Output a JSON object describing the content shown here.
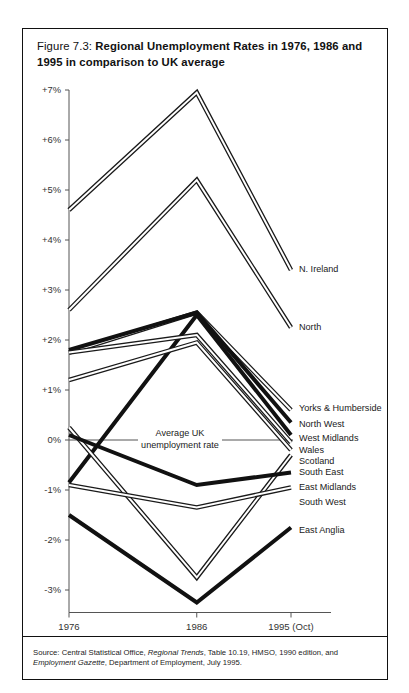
{
  "figure": {
    "number": "Figure 7.3:",
    "title": "Regional Unemployment Rates in 1976, 1986 and 1995 in comparison to UK average",
    "source_prefix": "Source: Central Statistical Office, ",
    "source_italic_1": "Regional Trends",
    "source_mid": ", Table 10.19, HMSO, 1990 edition, and ",
    "source_italic_2": "Employment Gazette",
    "source_suffix": ", Department of Employment, July 1995."
  },
  "annotation": {
    "line1": "Average UK",
    "line2": "unemployment rate"
  },
  "chart_data": {
    "type": "line",
    "title": "Regional Unemployment Rates in 1976, 1986 and 1995 in comparison to UK average",
    "xlabel": "",
    "ylabel": "",
    "x": [
      "1976",
      "1986",
      "1995 (Oct)"
    ],
    "xtick_labels": [
      "1976",
      "1986",
      "1995 (Oct)"
    ],
    "ytick_labels": [
      "+7%",
      "+6%",
      "+5%",
      "+4%",
      "+3%",
      "+2%",
      "+1%",
      "0%",
      "-1%",
      "-2%",
      "-3%"
    ],
    "ytick_values": [
      7,
      6,
      5,
      4,
      3,
      2,
      1,
      0,
      -1,
      -2,
      -3
    ],
    "ylim": [
      -3.5,
      7.3
    ],
    "grid": false,
    "legend": "inline-right-labels",
    "units": "percentage points relative to UK average",
    "series": [
      {
        "name": "N. Ireland",
        "values": [
          4.6,
          6.95,
          3.4
        ],
        "style": "double",
        "label_y": 3.4
      },
      {
        "name": "North",
        "values": [
          2.6,
          5.2,
          2.25
        ],
        "style": "double",
        "label_y": 2.25
      },
      {
        "name": "Yorks & Humberside",
        "values": [
          1.75,
          2.55,
          0.6
        ],
        "style": "double",
        "label_y": 0.62
      },
      {
        "name": "North West",
        "values": [
          1.8,
          2.55,
          0.35
        ],
        "style": "thick",
        "label_y": 0.3
      },
      {
        "name": "West Midlands",
        "values": [
          -0.85,
          2.5,
          0.1
        ],
        "style": "thick",
        "label_y": 0.02
      },
      {
        "name": "Wales",
        "values": [
          1.75,
          2.1,
          -0.05
        ],
        "style": "double",
        "label_y": -0.22
      },
      {
        "name": "Scotland",
        "values": [
          1.2,
          1.95,
          -0.2
        ],
        "style": "double",
        "label_y": -0.44
      },
      {
        "name": "South East",
        "values": [
          0.25,
          -2.75,
          -0.3
        ],
        "style": "double",
        "label_y": -0.66
      },
      {
        "name": "East Midlands",
        "values": [
          0.1,
          -0.9,
          -0.65
        ],
        "style": "thick",
        "label_y": -0.95
      },
      {
        "name": "South West",
        "values": [
          -0.9,
          -1.35,
          -0.95
        ],
        "style": "double",
        "label_y": -1.25
      },
      {
        "name": "East Anglia",
        "values": [
          -1.5,
          -3.25,
          -1.75
        ],
        "style": "thick",
        "label_y": -1.82
      }
    ]
  }
}
